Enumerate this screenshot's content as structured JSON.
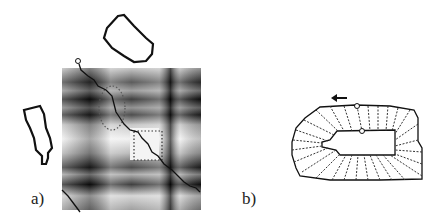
{
  "figure": {
    "panels": [
      {
        "id": "a",
        "label": "a)",
        "description": "Similarity matrix with warping path between two contours"
      },
      {
        "id": "b",
        "label": "b)",
        "description": "Correspondences between outer and inner contour with direction arrow"
      }
    ]
  },
  "colors": {
    "ink": "#111111",
    "background": "#ffffff"
  }
}
